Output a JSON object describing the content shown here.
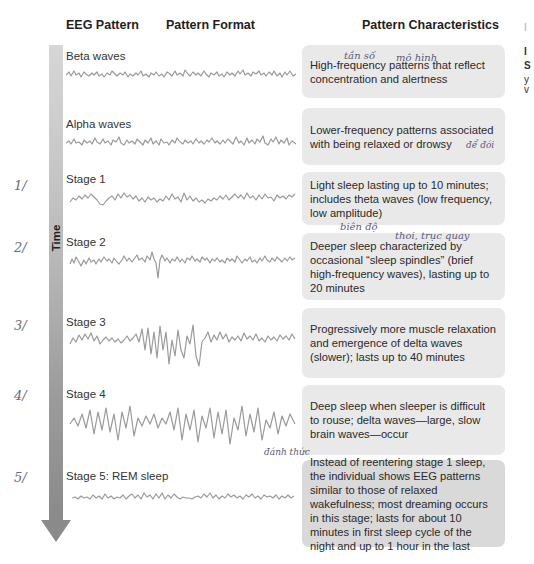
{
  "headers": {
    "eeg_pattern": "EEG Pattern",
    "pattern_format": "Pattern Format",
    "pattern_characteristics": "Pattern Characteristics"
  },
  "time_axis": {
    "label": "Time",
    "arrow_color_top": "#d7d7d7",
    "arrow_color_bottom": "#8a8a8a"
  },
  "rows": [
    {
      "name": "Beta waves",
      "characteristics": "High-frequency patterns that reflect concentration and alertness"
    },
    {
      "name": "Alpha waves",
      "characteristics": "Lower-frequency patterns associated with being relaxed or drowsy"
    },
    {
      "name": "Stage 1",
      "characteristics": "Light sleep lasting up to 10 minutes; includes theta waves (low frequency, low amplitude)"
    },
    {
      "name": "Stage 2",
      "characteristics": "Deeper sleep characterized by occasional “sleep spindles” (brief high-frequency waves), lasting up to 20 minutes"
    },
    {
      "name": "Stage 3",
      "characteristics": "Progressively more muscle relaxation and emergence of delta waves (slower); lasts up to 40 minutes"
    },
    {
      "name": "Stage 4",
      "characteristics": "Deep sleep when sleeper is difficult to rouse; delta waves—large, slow brain waves—occur"
    },
    {
      "name": "Stage 5: REM sleep",
      "characteristics": "Instead of reentering stage 1 sleep, the individual shows EEG patterns similar to those of relaxed wakefulness; most dreaming occurs in this stage; lasts for about 10 minutes in first sleep cycle of the night and up to 1 hour in the last"
    }
  ],
  "handwritten_notes": {
    "stage_numbers": [
      "1/",
      "2/",
      "3/",
      "4/",
      "5/"
    ],
    "beta_frequency": "tần số",
    "beta_patterns": "mô hình",
    "alpha_drowsy": "để đói",
    "stage1_amplitude": "biên độ",
    "stage2_spindles": "thoi, trục quay",
    "stage4_rouse": "đánh thức"
  },
  "right_edge_fragments": [
    "I",
    "I",
    "S",
    "y",
    "v"
  ]
}
